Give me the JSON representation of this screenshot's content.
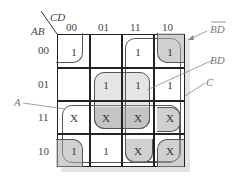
{
  "kmap": {
    "row_var": "AB",
    "col_var": "CD",
    "col_labels": [
      "00",
      "01",
      "11",
      "10"
    ],
    "row_labels": [
      "00",
      "01",
      "11",
      "10"
    ],
    "cells": [
      [
        "1",
        "",
        "1",
        "1"
      ],
      [
        "",
        "1",
        "1",
        "1"
      ],
      [
        "X",
        "X",
        "X",
        "X"
      ],
      [
        "1",
        "1",
        "X",
        "X"
      ]
    ]
  },
  "groups": {
    "a_label": "A",
    "bd_label": "BD",
    "c_label": "C",
    "bdbar_label": "BD"
  },
  "colors": {
    "grid_line": "#222222",
    "shade": "#b0b0b0",
    "text": "#333333"
  }
}
